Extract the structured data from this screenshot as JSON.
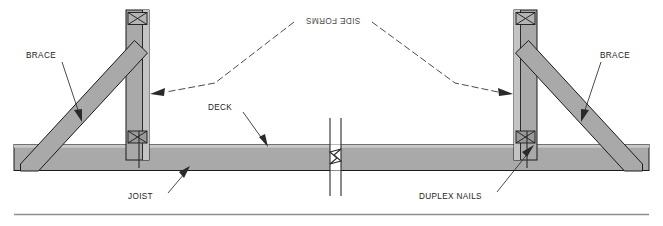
{
  "document": {
    "type": "construction-detail-drawing",
    "title_text": "SIDE FORMS",
    "description": "Cross-section detail of concrete bridge deck side forms supported by braces on a joist"
  },
  "labels": {
    "side_forms": "SIDE FORMS",
    "brace_left": "BRACE",
    "brace_right": "BRACE",
    "deck": "DECK",
    "joist": "JOIST",
    "duplex_nails": "DUPLEX NAILS"
  },
  "colors": {
    "member_fill": "#a9a9a9",
    "member_fill_light": "#c4c4c4",
    "outline": "#1a1a1a",
    "label_text": "#1c1c1c",
    "leader": "#2a2a2a",
    "rule": "#8e8e8e",
    "background": "#ffffff"
  },
  "components": [
    {
      "name": "joist",
      "kind": "horizontal-beam",
      "label": "JOIST"
    },
    {
      "name": "side-form-left",
      "kind": "vertical-post",
      "label": "SIDE FORMS"
    },
    {
      "name": "side-form-right",
      "kind": "vertical-post",
      "label": "SIDE FORMS"
    },
    {
      "name": "brace-left",
      "kind": "diagonal-brace",
      "label": "BRACE"
    },
    {
      "name": "brace-right",
      "kind": "diagonal-brace",
      "label": "BRACE"
    },
    {
      "name": "deck-surface",
      "kind": "surface",
      "label": "DECK"
    },
    {
      "name": "duplex-nail-left",
      "kind": "fastener",
      "label": "DUPLEX NAILS"
    },
    {
      "name": "duplex-nail-right",
      "kind": "fastener",
      "label": "DUPLEX NAILS"
    },
    {
      "name": "break-symbol",
      "kind": "break-symbol",
      "label": ""
    }
  ]
}
